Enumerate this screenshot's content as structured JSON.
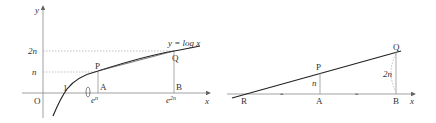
{
  "left_figure": {
    "axis_y_label": "y",
    "axis_x_label": "x",
    "origin_label": "O",
    "one_label": "1",
    "curve_label": "y = log x",
    "y_tick_2n": "2n",
    "y_tick_n": "n",
    "point_P": "P",
    "point_Q": "Q",
    "point_A": "A",
    "point_B": "B",
    "x_tick_en": "e",
    "x_tick_en_sup": "n",
    "x_tick_e2n": "e",
    "x_tick_e2n_sup": "2n",
    "region_marker": "()"
  },
  "right_figure": {
    "axis_x_label": "x",
    "point_R": "R",
    "point_A": "A",
    "point_B": "B",
    "point_P": "P",
    "point_Q": "Q",
    "len_PA": "n",
    "len_QB": "2n",
    "equal_mark": "="
  },
  "colors": {
    "axis": "#888888",
    "curve": "#222222",
    "dotted": "#999999"
  }
}
